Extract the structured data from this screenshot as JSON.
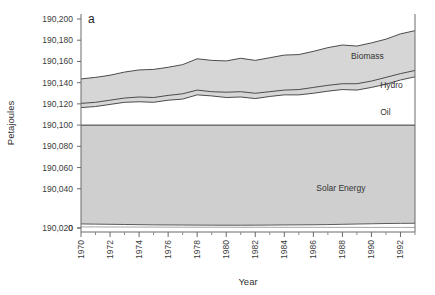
{
  "figure": {
    "panel_label": "a",
    "background_color": "#ffffff"
  },
  "chart_data": {
    "type": "area",
    "title": "",
    "subtitle": "",
    "xlabel": "Year",
    "ylabel": "Petajoules",
    "stacked": true,
    "grid": false,
    "legend_position": "inline-labels",
    "axis_break": true,
    "axis_break_note": "y axis jumps from 0 to 190,020; region below 190,100 is the Solar Energy band",
    "xlim": [
      1970,
      1993
    ],
    "ylim": [
      0,
      190200
    ],
    "x": [
      1970,
      1971,
      1972,
      1973,
      1974,
      1975,
      1976,
      1977,
      1978,
      1979,
      1980,
      1981,
      1982,
      1983,
      1984,
      1985,
      1986,
      1987,
      1988,
      1989,
      1990,
      1991,
      1992,
      1993
    ],
    "xticks_major": [
      1970,
      1972,
      1974,
      1976,
      1978,
      1980,
      1982,
      1984,
      1986,
      1988,
      1990,
      1992
    ],
    "xtick_labels": [
      "1970",
      "1972",
      "1974",
      "1976",
      "1978",
      "1980",
      "1982",
      "1984",
      "1986",
      "1988",
      "1990",
      "1992"
    ],
    "xticks_minor": [
      1971,
      1973,
      1975,
      1977,
      1979,
      1981,
      1983,
      1985,
      1987,
      1989,
      1991,
      1993
    ],
    "yticks": [
      0,
      190020,
      190040,
      190060,
      190080,
      190100,
      190120,
      190140,
      190160,
      190180,
      190200
    ],
    "ytick_labels": [
      "0",
      "190,020",
      "190,040",
      "190,060",
      "190,080",
      "190,100",
      "190,120",
      "190,140",
      "190,160",
      "190,180",
      "190,200"
    ],
    "series": [
      {
        "name": "Solar Energy",
        "label": "Solar Energy",
        "fill_color": "#cfcfcf",
        "line_color": "#4a4a4a",
        "label_x": 1986.2,
        "label_y": 190041,
        "lower": [
          190002.5,
          190002.4,
          190002.3,
          190002.2,
          190002.1,
          190002.0,
          190001.9,
          190001.8,
          190001.8,
          190001.7,
          190001.7,
          190001.6,
          190001.6,
          190001.6,
          190001.5,
          190001.5,
          190001.5,
          190001.4,
          190001.4,
          190001.4,
          190001.3,
          190001.3,
          190001.3,
          190001.3
        ],
        "upper": [
          190009.0,
          190008.6,
          190008.2,
          190007.8,
          190007.4,
          190007.0,
          190006.8,
          190006.6,
          190006.4,
          190006.3,
          190006.2,
          190006.2,
          190006.3,
          190006.5,
          190006.8,
          190007.0,
          190007.2,
          190007.6,
          190008.2,
          190008.8,
          190009.4,
          190010.0,
          190010.3,
          190010.5
        ],
        "top_boundary_value": 190100,
        "note": "band fills from its upper line up to the 190,100 break line"
      },
      {
        "name": "Oil",
        "label": "Oil",
        "fill_color": "#ffffff",
        "line_color": "#3a3a3a",
        "label_x": 1990.6,
        "label_y": 190112,
        "values": [
          190116.5,
          190117.5,
          190119.5,
          190121.5,
          190122.0,
          190121.5,
          190123.5,
          190124.5,
          190128.5,
          190127.5,
          190126.0,
          190126.5,
          190125.0,
          190127.0,
          190128.5,
          190128.5,
          190130.0,
          190132.0,
          190133.5,
          190133.0,
          190135.5,
          190138.5,
          190142.5,
          190145.5
        ]
      },
      {
        "name": "Hydro",
        "label": "Hydro",
        "fill_color": "#d6d6d6",
        "line_color": "#3a3a3a",
        "label_x": 1990.6,
        "label_y": 190137.5,
        "values": [
          190120.5,
          190121.5,
          190123.5,
          190125.5,
          190126.5,
          190126.0,
          190128.0,
          190129.5,
          190133.0,
          190131.5,
          190131.0,
          190131.5,
          190130.0,
          190131.5,
          190133.0,
          190133.5,
          190135.5,
          190137.5,
          190139.0,
          190139.0,
          190141.5,
          190145.0,
          190148.5,
          190151.5
        ]
      },
      {
        "name": "Biomass",
        "label": "Biomass",
        "fill_color": "#d6d6d6",
        "line_color": "#3a3a3a",
        "label_x": 1988.6,
        "label_y": 190165.5,
        "values": [
          190143.5,
          190145.0,
          190147.0,
          190150.0,
          190152.0,
          190152.5,
          190154.5,
          190157.0,
          190162.5,
          190161.0,
          190160.5,
          190163.0,
          190161.0,
          190163.5,
          190166.0,
          190166.5,
          190169.5,
          190173.0,
          190175.5,
          190174.5,
          190177.5,
          190181.0,
          190186.0,
          190189.0
        ]
      }
    ]
  }
}
